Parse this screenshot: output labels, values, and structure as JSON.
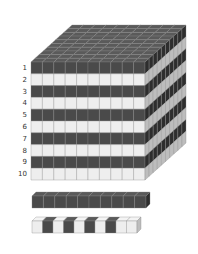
{
  "diagram": {
    "cube": {
      "rows": 10,
      "columns": 10,
      "depth": 10,
      "row_labels": [
        "1",
        "2",
        "3",
        "4",
        "5",
        "6",
        "7",
        "8",
        "9",
        "10"
      ],
      "layer_pattern": [
        "dark",
        "light",
        "dark",
        "light",
        "dark",
        "light",
        "dark",
        "light",
        "dark",
        "light"
      ]
    },
    "rod_dark": {
      "units": 10,
      "pattern": "all dark"
    },
    "rod_striped": {
      "units": 10,
      "pattern": [
        "light",
        "dark",
        "light",
        "dark",
        "light",
        "dark",
        "light",
        "dark",
        "light",
        "light"
      ]
    },
    "colors": {
      "dark_front": "#4a4a4a",
      "dark_top": "#5a5a5a",
      "dark_side": "#2e2e2e",
      "light_front": "#eeeeee",
      "light_side": "#bdbdbd",
      "grid_line": "#888888",
      "label": "#333333"
    }
  }
}
